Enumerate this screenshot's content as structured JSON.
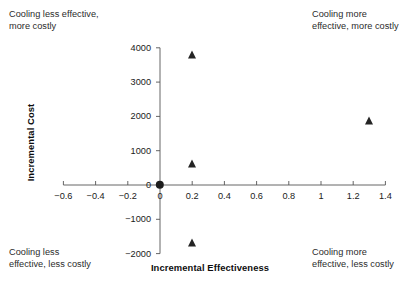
{
  "chart_data": {
    "type": "scatter",
    "title": "",
    "xlabel": "Incremental Effectiveness",
    "ylabel": "Incremental Cost",
    "xlim": [
      -0.7,
      1.45
    ],
    "ylim": [
      -2150,
      4150
    ],
    "xticks": [
      -0.6,
      -0.4,
      -0.2,
      0,
      0.2,
      0.4,
      0.6,
      0.8,
      1,
      1.2,
      1.4
    ],
    "xticklabels": [
      "−0.6",
      "−0.4",
      "−0.2",
      "0",
      "0.2",
      "0.4",
      "0.6",
      "0.8",
      "1",
      "1.2",
      "1.4"
    ],
    "yticks": [
      -2000,
      -1000,
      0,
      1000,
      2000,
      3000,
      4000
    ],
    "yticklabels": [
      "−2000",
      "−1000",
      "0",
      "1000",
      "2000",
      "3000",
      "4000"
    ],
    "grid": false,
    "legend": false,
    "series": [
      {
        "name": "Reference",
        "marker": "circle",
        "color": "#1c1c1c",
        "points": [
          {
            "x": 0,
            "y": 0
          }
        ]
      },
      {
        "name": "Comparators",
        "marker": "triangle",
        "color": "#242424",
        "points": [
          {
            "x": 0.2,
            "y": 3800
          },
          {
            "x": 0.2,
            "y": 620
          },
          {
            "x": 0.2,
            "y": -1680
          },
          {
            "x": 1.3,
            "y": 1880
          }
        ]
      }
    ],
    "annotations": [
      {
        "id": "top-left",
        "text": "Cooling less effective,\nmore costly",
        "quadrant": "upper-left"
      },
      {
        "id": "top-right",
        "text": "Cooling more\neffective, more costly",
        "quadrant": "upper-right"
      },
      {
        "id": "bottom-left",
        "text": "Cooling less\neffective, less costly",
        "quadrant": "lower-left"
      },
      {
        "id": "bottom-right",
        "text": "Cooling more\neffective, less costly",
        "quadrant": "lower-right"
      }
    ]
  }
}
